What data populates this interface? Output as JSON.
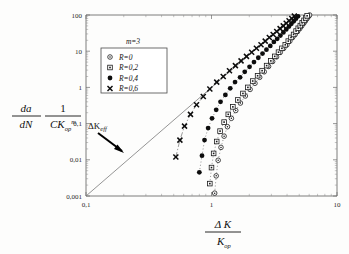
{
  "chart_data": {
    "type": "scatter",
    "title": "",
    "xlabel": "ΔK / K_op",
    "ylabel": "(da/dN)(1/(C K_op^m))",
    "xscale": "log",
    "yscale": "log",
    "xlim": [
      0.1,
      10
    ],
    "ylim": [
      0.001,
      100
    ],
    "grid": false,
    "legend_position": "upper-left",
    "annotations": [
      {
        "text": "m=3",
        "role": "parameter-label"
      },
      {
        "text": "ΔK_eff",
        "role": "arrow-annotation",
        "points_to": "reference-line"
      }
    ],
    "xticklabels": [
      "0,1",
      "1",
      "10"
    ],
    "xtickvalues": [
      0.1,
      1,
      10
    ],
    "yticklabels": [
      "0,001",
      "0,01",
      "0,1",
      "1",
      "10",
      "100"
    ],
    "ytickvalues": [
      0.001,
      0.01,
      0.1,
      1,
      10,
      100
    ],
    "reference_line": {
      "name": "ΔK_eff reference",
      "style": "solid",
      "from": [
        0.1,
        0.001
      ],
      "to": [
        4.8,
        110
      ]
    },
    "series": [
      {
        "name": "R=0",
        "marker": "open-circle-dot",
        "line": "dotted",
        "points": [
          [
            1.06,
            0.0012
          ],
          [
            1.09,
            0.0036
          ],
          [
            1.13,
            0.0097
          ],
          [
            1.19,
            0.022
          ],
          [
            1.26,
            0.045
          ],
          [
            1.34,
            0.082
          ],
          [
            1.44,
            0.14
          ],
          [
            1.56,
            0.23
          ],
          [
            1.7,
            0.37
          ],
          [
            1.86,
            0.58
          ],
          [
            2.03,
            0.88
          ],
          [
            2.22,
            1.3
          ],
          [
            2.42,
            1.9
          ],
          [
            2.63,
            2.7
          ],
          [
            2.85,
            3.8
          ],
          [
            3.07,
            5.2
          ],
          [
            3.3,
            7.0
          ],
          [
            3.53,
            9.3
          ],
          [
            3.76,
            12
          ],
          [
            3.99,
            15
          ],
          [
            4.21,
            19
          ],
          [
            4.43,
            24
          ],
          [
            4.64,
            29
          ],
          [
            4.85,
            35
          ],
          [
            5.05,
            42
          ],
          [
            5.24,
            50
          ],
          [
            5.43,
            59
          ],
          [
            5.61,
            69
          ],
          [
            5.78,
            80
          ],
          [
            5.95,
            92
          ],
          [
            6.05,
            100
          ]
        ]
      },
      {
        "name": "R=0,2",
        "marker": "open-square-dot",
        "line": "dotted",
        "points": [
          [
            0.97,
            0.0022
          ],
          [
            1.0,
            0.0061
          ],
          [
            1.04,
            0.015
          ],
          [
            1.1,
            0.032
          ],
          [
            1.17,
            0.062
          ],
          [
            1.26,
            0.11
          ],
          [
            1.36,
            0.18
          ],
          [
            1.48,
            0.29
          ],
          [
            1.62,
            0.45
          ],
          [
            1.78,
            0.68
          ],
          [
            1.95,
            1.0
          ],
          [
            2.13,
            1.5
          ],
          [
            2.33,
            2.1
          ],
          [
            2.53,
            2.9
          ],
          [
            2.75,
            4.0
          ],
          [
            2.97,
            5.4
          ],
          [
            3.19,
            7.2
          ],
          [
            3.42,
            9.4
          ],
          [
            3.64,
            12
          ],
          [
            3.87,
            15
          ],
          [
            4.09,
            19
          ],
          [
            4.3,
            24
          ],
          [
            4.51,
            29
          ],
          [
            4.72,
            36
          ],
          [
            4.91,
            43
          ],
          [
            5.1,
            51
          ],
          [
            5.28,
            61
          ],
          [
            5.46,
            71
          ],
          [
            5.63,
            83
          ],
          [
            5.78,
            95
          ]
        ]
      },
      {
        "name": "R=0,4",
        "marker": "filled-circle",
        "line": "dotted",
        "points": [
          [
            0.8,
            0.0045
          ],
          [
            0.84,
            0.013
          ],
          [
            0.88,
            0.035
          ],
          [
            0.94,
            0.075
          ],
          [
            1.01,
            0.14
          ],
          [
            1.09,
            0.24
          ],
          [
            1.18,
            0.4
          ],
          [
            1.29,
            0.62
          ],
          [
            1.41,
            0.94
          ],
          [
            1.54,
            1.4
          ],
          [
            1.69,
            1.9
          ],
          [
            1.84,
            2.7
          ],
          [
            2.01,
            3.7
          ],
          [
            2.18,
            5.0
          ],
          [
            2.36,
            6.6
          ],
          [
            2.55,
            8.6
          ],
          [
            2.74,
            11
          ],
          [
            2.94,
            14
          ],
          [
            3.14,
            18
          ],
          [
            3.34,
            22
          ],
          [
            3.54,
            27
          ],
          [
            3.74,
            33
          ],
          [
            3.94,
            40
          ],
          [
            4.14,
            48
          ],
          [
            4.33,
            57
          ],
          [
            4.52,
            67
          ],
          [
            4.71,
            79
          ],
          [
            4.89,
            92
          ],
          [
            5.0,
            102
          ]
        ]
      },
      {
        "name": "R=0,6",
        "marker": "cross-x",
        "line": "dash-dot",
        "points": [
          [
            0.52,
            0.012
          ],
          [
            0.56,
            0.035
          ],
          [
            0.61,
            0.085
          ],
          [
            0.68,
            0.18
          ],
          [
            0.76,
            0.33
          ],
          [
            0.86,
            0.56
          ],
          [
            0.97,
            0.9
          ],
          [
            1.1,
            1.4
          ],
          [
            1.24,
            2.0
          ],
          [
            1.39,
            2.9
          ],
          [
            1.55,
            4.0
          ],
          [
            1.72,
            5.4
          ],
          [
            1.9,
            7.2
          ],
          [
            2.09,
            9.4
          ],
          [
            2.28,
            12
          ],
          [
            2.48,
            15
          ],
          [
            2.68,
            19
          ],
          [
            2.89,
            24
          ],
          [
            3.1,
            29
          ],
          [
            3.31,
            35
          ],
          [
            3.52,
            42
          ],
          [
            3.73,
            50
          ],
          [
            3.94,
            59
          ],
          [
            4.15,
            69
          ],
          [
            4.36,
            80
          ],
          [
            4.57,
            93
          ],
          [
            4.7,
            102
          ]
        ]
      }
    ]
  },
  "legend": {
    "parameter": "m=3",
    "entries": [
      {
        "label": "R=0",
        "marker": "open-circle-dot"
      },
      {
        "label": "R=0,2",
        "marker": "open-square-dot"
      },
      {
        "label": "R=0,4",
        "marker": "filled-circle"
      },
      {
        "label": "R=0,6",
        "marker": "cross-x"
      }
    ]
  },
  "axis_labels": {
    "y_numerator_1": "da",
    "y_denominator_1": "dN",
    "y_numerator_2": "1",
    "y_denominator_2": "CK",
    "y_denominator_2_sub": "op",
    "y_denominator_2_sup": "m",
    "x_numerator": "Δ K",
    "x_denominator": "K",
    "x_denominator_sub": "op"
  },
  "annotation": {
    "delta_k_eff": "ΔK",
    "delta_k_eff_sub": "eff"
  }
}
